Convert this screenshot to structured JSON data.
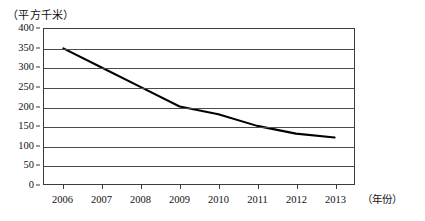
{
  "figure": {
    "unit_caption": "（平方千米）",
    "x_axis_title": "（年份）",
    "axis_color": "#3b3b3b",
    "grid_color": "#4a4a4a",
    "series_color": "#000000",
    "background": "#ffffff"
  },
  "chart_data": {
    "type": "line",
    "title": "",
    "subtitle": "",
    "xlabel": "年份",
    "ylabel": "平方千米",
    "categories": [
      "2006",
      "2007",
      "2008",
      "2009",
      "2010",
      "2011",
      "2012",
      "2013"
    ],
    "x": [
      2006,
      2007,
      2008,
      2009,
      2010,
      2011,
      2012,
      2013
    ],
    "values": [
      350,
      300,
      250,
      200,
      180,
      150,
      130,
      120
    ],
    "series": [
      {
        "name": "面积",
        "values": [
          350,
          300,
          250,
          200,
          180,
          150,
          130,
          120
        ]
      }
    ],
    "ylim": [
      0,
      400
    ],
    "yticks": [
      0,
      50,
      100,
      150,
      200,
      250,
      300,
      350,
      400
    ],
    "ytick_labels": [
      "0",
      "50",
      "100",
      "150",
      "200",
      "250",
      "300",
      "350",
      "400"
    ],
    "xtick_labels": [
      "2006",
      "2007",
      "2008",
      "2009",
      "2010",
      "2011",
      "2012",
      "2013"
    ],
    "grid": true,
    "grid_axis": "y",
    "legend": false,
    "legend_position": "none",
    "markers": false,
    "annotations": []
  }
}
